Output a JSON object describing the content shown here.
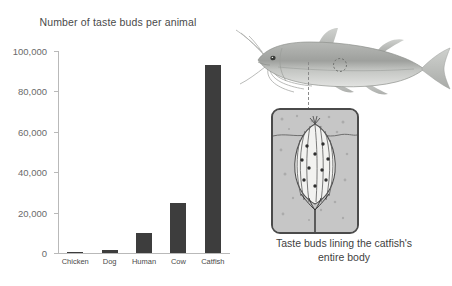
{
  "chart_data": {
    "type": "bar",
    "title": "Number of taste buds per animal",
    "xlabel": "",
    "ylabel": "",
    "categories": [
      "Chicken",
      "Dog",
      "Human",
      "Cow",
      "Catfish"
    ],
    "values": [
      30,
      1700,
      10000,
      25000,
      93000
    ],
    "ylim": [
      0,
      100000
    ],
    "yticks": [
      0,
      20000,
      40000,
      60000,
      80000,
      100000
    ],
    "ytick_labels": [
      "0",
      "20,000",
      "40,000",
      "60,000",
      "80,000",
      "100,000"
    ],
    "grid": false,
    "legend": null,
    "bar_color": "#3d3d3d",
    "axis_color": "#b9b9b9"
  },
  "illustration": {
    "fish_name": "catfish-illustration",
    "callout_name": "callout-dashed-line",
    "zoom_panel_name": "taste-bud-magnified-panel",
    "caption_line_1": "Taste buds lining the catfish's",
    "caption_line_2": "entire body"
  },
  "colors": {
    "background": "#ffffff",
    "bar": "#3d3d3d",
    "axis": "#b9b9b9",
    "text": "#3f3f3f",
    "tick_text": "#6a6a6a",
    "panel_border": "#4a4a4a",
    "panel_fill": "#c9c9c9"
  }
}
